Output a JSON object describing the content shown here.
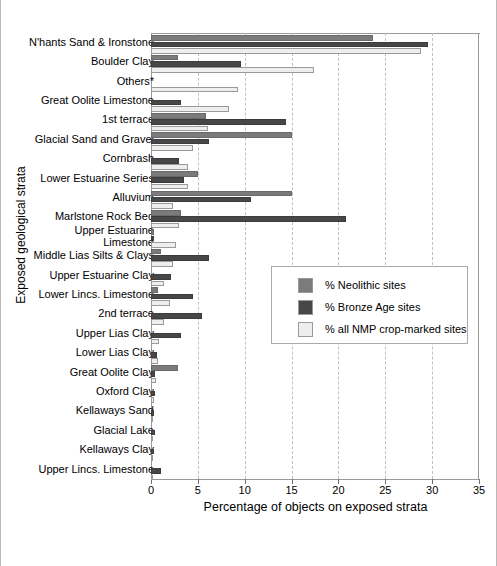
{
  "chart_data": {
    "type": "bar",
    "orientation": "horizontal",
    "title": "",
    "xlabel": "Percentage of objects on exposed strata",
    "ylabel": "Exposed geological strata",
    "xlim": [
      0,
      35
    ],
    "xticks": [
      0,
      5,
      10,
      15,
      20,
      25,
      30,
      35
    ],
    "grid": "vertical-dashed",
    "legend_position": "middle-right",
    "categories": [
      "N'hants Sand & Ironstone",
      "Boulder Clay",
      "Others*",
      "Great Oolite Limestone",
      "1st terrace",
      "Glacial Sand and Gravel",
      "Cornbrash",
      "Lower Estuarine Series",
      "Alluvium",
      "Marlstone Rock Bed",
      "Upper Estuarine\nLimestone",
      "Middle Lias Silts & Clays",
      "Upper Estuarine Clay",
      "Lower Lincs. Limestone",
      "2nd terrace",
      "Upper Lias Clay",
      "Lower Lias Clay",
      "Great Oolite Clay",
      "Oxford Clay",
      "Kellaways Sand",
      "Glacial Lake",
      "Kellaways Clay",
      "Upper Lincs. Limestone"
    ],
    "series": [
      {
        "name": "% Neolithic sites",
        "color": "#7b7b7b",
        "values": [
          23.7,
          2.9,
          0,
          0,
          5.9,
          15.0,
          0,
          5.0,
          15.0,
          3.2,
          0.3,
          1.1,
          0,
          0.8,
          0,
          0,
          0,
          2.9,
          0,
          0,
          0,
          0,
          0
        ]
      },
      {
        "name": "% Bronze Age sites",
        "color": "#474747",
        "values": [
          29.6,
          9.6,
          0,
          3.2,
          14.4,
          6.2,
          3.0,
          3.5,
          10.7,
          20.8,
          0.3,
          6.2,
          2.1,
          4.5,
          5.4,
          3.2,
          0.6,
          0.4,
          0.4,
          0.3,
          0.4,
          0.3,
          1.1
        ]
      },
      {
        "name": "% all NMP crop-marked sites",
        "color": "#eeeeee",
        "values": [
          28.8,
          17.4,
          9.3,
          8.3,
          6.1,
          4.5,
          4.0,
          4.0,
          2.3,
          3.0,
          2.7,
          2.4,
          1.4,
          2.0,
          1.4,
          0.9,
          0.8,
          0.5,
          0.3,
          0.2,
          0.2,
          0.2,
          0.2
        ]
      }
    ]
  },
  "legend": {
    "items": [
      {
        "label": "% Neolithic sites",
        "color": "#7b7b7b"
      },
      {
        "label": "% Bronze Age sites",
        "color": "#474747"
      },
      {
        "label": "% all NMP crop-marked sites",
        "color": "#eeeeee"
      }
    ]
  }
}
